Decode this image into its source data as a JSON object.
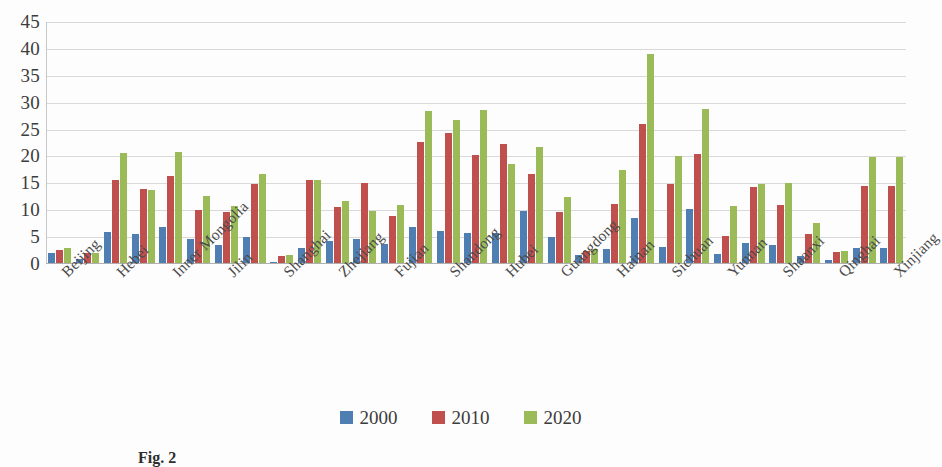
{
  "chart_data": {
    "type": "bar",
    "title": "",
    "xlabel": "",
    "ylabel": "",
    "ylim": [
      0,
      45
    ],
    "yticks": [
      0,
      5,
      10,
      15,
      20,
      25,
      30,
      35,
      40,
      45
    ],
    "grid": true,
    "legend_position": "bottom",
    "categories": [
      "Beijing",
      "Tianjin",
      "Hebei",
      "Shanxi",
      "Inner Mongolia",
      "Liaoning",
      "Jilin",
      "Heilongjiang",
      "Shanghai",
      "Jiangsu",
      "Zhejiang",
      "Anhui",
      "Fujian",
      "Jiangxi",
      "Shandong",
      "Henan",
      "Hubei",
      "Hunan",
      "Guangdong",
      "Guangxi",
      "Hainan",
      "Chongqing",
      "Sichuan",
      "Guizhou",
      "Yunnan",
      "Shanxi2",
      "Shaanxi",
      "Gansu",
      "Qinghai",
      "Ningxia",
      "Xinjiang"
    ],
    "tick_labels": [
      "Beijing",
      "Hebei",
      "Inner Mongolia",
      "Jilin",
      "Shanghai",
      "Zhejiang",
      "Fujian",
      "Shandong",
      "Hubei",
      "Guangdong",
      "Hainan",
      "Sichuan",
      "Yunnan",
      "Shaanxi",
      "Qinghai",
      "Xinjiang"
    ],
    "series": [
      {
        "name": "2000",
        "color": "#4f7eb3",
        "values": [
          2.0,
          1.0,
          6.0,
          5.6,
          6.8,
          4.6,
          3.6,
          5.1,
          0.4,
          3.0,
          4.2,
          4.7,
          3.7,
          6.8,
          6.2,
          5.7,
          5.8,
          9.8,
          5.0,
          1.6,
          2.8,
          8.6,
          3.2,
          10.3,
          1.9,
          4.0,
          3.5,
          1.4,
          0.8,
          3.0,
          3.0
        ]
      },
      {
        "name": "2010",
        "color": "#c0504d",
        "values": [
          2.6,
          2.0,
          15.6,
          14.0,
          16.3,
          10.1,
          9.6,
          14.9,
          1.4,
          15.7,
          10.6,
          15.0,
          9.0,
          22.6,
          24.4,
          20.3,
          22.3,
          16.8,
          9.7,
          2.4,
          11.1,
          26.0,
          14.8,
          20.4,
          5.2,
          14.3,
          11.0,
          5.5,
          2.3,
          14.5,
          14.5
        ]
      },
      {
        "name": "2020",
        "color": "#9bbb59",
        "values": [
          3.0,
          2.1,
          20.6,
          13.7,
          20.8,
          12.7,
          10.7,
          16.7,
          1.6,
          15.7,
          11.8,
          9.8,
          11.0,
          28.4,
          26.8,
          28.6,
          18.6,
          21.7,
          12.5,
          2.8,
          17.5,
          39.0,
          20.0,
          28.9,
          10.8,
          14.9,
          15.0,
          7.7,
          2.4,
          19.9,
          19.9
        ]
      }
    ],
    "legend": [
      "2000",
      "2010",
      "2020"
    ]
  },
  "caption": {
    "prefix": "Fig. 2",
    "text": ""
  }
}
